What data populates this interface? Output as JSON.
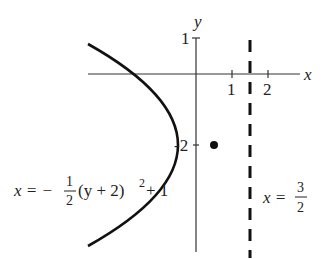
{
  "diagram": {
    "axes": {
      "x_label": "x",
      "y_label": "y",
      "x_ticks": [
        {
          "value": 1,
          "label": "1"
        },
        {
          "value": 2,
          "label": "2"
        }
      ],
      "y_ticks": [
        {
          "value": 1,
          "label": "1"
        },
        {
          "value": -2,
          "label": "-2"
        }
      ]
    },
    "parabola": {
      "equation_lhs": "x = −",
      "frac_num": "1",
      "frac_den": "2",
      "equation_rhs": "(y + 2)",
      "exponent": "2",
      "equation_tail": " + 1",
      "vertex": [
        1,
        -2
      ],
      "color": "#111111"
    },
    "focus": {
      "point": [
        0.5,
        -2
      ]
    },
    "directrix": {
      "equation_lhs": "x =",
      "frac_num": "3",
      "frac_den": "2",
      "value": 1.5,
      "style": "dashed"
    }
  }
}
